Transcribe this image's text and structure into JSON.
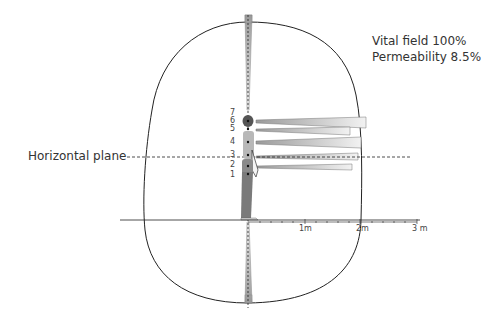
{
  "info": {
    "vital_field": "Vital field 100%",
    "permeability": "Permeability 8.5%"
  },
  "plane_label": "Horizontal plane",
  "ruler": {
    "ticks": [
      "1m",
      "2m",
      "3 m"
    ]
  },
  "points": [
    "7",
    "6",
    "5",
    "4",
    "3",
    "2",
    "1"
  ],
  "colors": {
    "outline": "#222222",
    "figure_shirt": "#b8b8b8",
    "figure_pants": "#7a7a7a",
    "bar_dark": "#8a8a8a",
    "bar_light": "#f4f4f4"
  }
}
